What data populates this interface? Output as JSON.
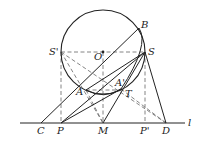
{
  "diagram": {
    "type": "geometry",
    "circle": {
      "center": "O",
      "cx": 103,
      "cy": 52,
      "r": 42
    },
    "points": {
      "B": {
        "x": 139,
        "y": 28,
        "label": "B"
      },
      "O": {
        "x": 103,
        "y": 52,
        "label": "O"
      },
      "S_prime": {
        "x": 61,
        "y": 52,
        "label": "S'"
      },
      "S": {
        "x": 145,
        "y": 52,
        "label": "S"
      },
      "A": {
        "x": 86,
        "y": 90,
        "label": "A"
      },
      "A_prime": {
        "x": 121,
        "y": 89,
        "label": "A'"
      },
      "T": {
        "x": 123,
        "y": 90,
        "label": "T"
      },
      "C": {
        "x": 41,
        "y": 123,
        "label": "C"
      },
      "P": {
        "x": 61,
        "y": 123,
        "label": "P"
      },
      "M": {
        "x": 103,
        "y": 123,
        "label": "M"
      },
      "P_prime": {
        "x": 145,
        "y": 123,
        "label": "P'"
      },
      "D": {
        "x": 166,
        "y": 123,
        "label": "D"
      }
    },
    "line_label": "l",
    "colors": {
      "stroke": "#222222",
      "dashed": "#555555"
    }
  }
}
